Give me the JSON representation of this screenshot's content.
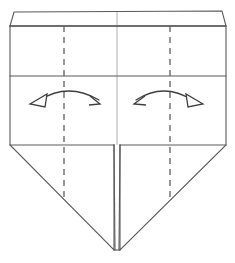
{
  "figure": {
    "kind": "origami-fold-diagram",
    "title": "",
    "background_color": "#ffffff",
    "line_color": "#5a5a5a",
    "crease_color": "#4c4c4c",
    "faint_crease_color": "#c9c9c9",
    "arrow_color": "#3e3e3e",
    "canvas": {
      "width": 235,
      "height": 263
    }
  },
  "shape": {
    "top_strip": {
      "name": "top-narrow-band",
      "points": "14,12 222,11 226,26 10,26"
    },
    "upper_panel": {
      "name": "upper-panel",
      "points": "10,26 226,26 226,76 10,76"
    },
    "middle_panel": {
      "name": "middle-panel",
      "points": "10,76 226,76 226,145 10,145"
    },
    "lower_left_flap": {
      "name": "lower-left-triangular-flap",
      "points": "10,145 114,145 114,250 10,145"
    },
    "lower_right_flap": {
      "name": "lower-right-triangular-flap",
      "points": "120,145 226,145 120,250"
    },
    "outline": {
      "name": "body-outline",
      "points": "10,26 226,26 226,145 120,250 114,250 10,145"
    }
  },
  "creases": {
    "dashed": [
      {
        "name": "left-vertical-crease",
        "x1": 64,
        "y1": 26,
        "x2": 64,
        "y2": 199
      },
      {
        "name": "right-vertical-crease",
        "x1": 170,
        "y1": 26,
        "x2": 170,
        "y2": 199
      }
    ],
    "faint": [
      {
        "name": "center-vertical-crease",
        "x1": 117,
        "y1": 12,
        "x2": 117,
        "y2": 145
      }
    ],
    "horizontal": [
      {
        "name": "top-band-divider",
        "x1": 10,
        "y1": 26,
        "x2": 226,
        "y2": 26
      },
      {
        "name": "upper-middle-divider",
        "x1": 10,
        "y1": 76,
        "x2": 226,
        "y2": 76
      },
      {
        "name": "shoulder-left",
        "x1": 10,
        "y1": 145,
        "x2": 114,
        "y2": 145
      },
      {
        "name": "shoulder-right",
        "x1": 120,
        "y1": 145,
        "x2": 226,
        "y2": 145
      }
    ],
    "center_gap": [
      {
        "name": "center-gap-left-edge",
        "x1": 114,
        "y1": 145,
        "x2": 115,
        "y2": 250
      },
      {
        "name": "center-gap-right-edge",
        "x1": 120,
        "y1": 145,
        "x2": 119,
        "y2": 250
      }
    ]
  },
  "arrows": {
    "left": {
      "name": "left-unfold-arrow",
      "direction": "outward-left-to-right",
      "arc_path": "M 40,100 Q 68,82 99,100",
      "hollow_head": {
        "name": "left-arrow-hollow-head",
        "points": "30,104 47,94 45,107"
      },
      "open_head": {
        "name": "left-arrow-line-head",
        "path": "M 90,96 L 100,104 L 89,105"
      }
    },
    "right": {
      "name": "right-unfold-arrow",
      "direction": "outward-right-to-left",
      "arc_path": "M 136,100 Q 164,82 192,100",
      "hollow_head": {
        "name": "right-arrow-hollow-head",
        "points": "203,104 186,94 188,107"
      },
      "open_head": {
        "name": "right-arrow-line-head",
        "path": "M 145,96 L 134,104 L 146,105"
      }
    }
  }
}
